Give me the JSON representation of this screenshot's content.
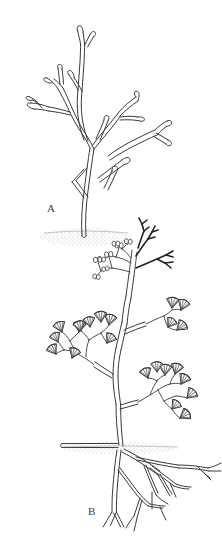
{
  "figure": {
    "background_color": "#ffffff",
    "ink_color": "#3a3a3a",
    "soil_color": "#9a9a9a",
    "width": 222,
    "height": 548
  },
  "panels": [
    {
      "id": "A",
      "label": "A",
      "caption": "Leafless dichotomously branching axes arising from a soil surface",
      "description": "Upright plant with repeatedly forking, naked, tapering axes ending in blunt rounded forked tips; slender basal stem emerging from a stippled ground patch.",
      "features": {
        "branching": "dichotomous",
        "leaves": "absent",
        "tip_shape": "blunt rounded fork",
        "substrate": "stippled soil mound",
        "root_system": "not shown"
      }
    },
    {
      "id": "B",
      "label": "B",
      "caption": "Branched shoot bearing fan-shaped leaves, terminal ovules and forked sporangiophores, with horizontal rhizome and dichotomous roots",
      "description": "Aerial axis forking repeatedly, bearing clusters of fan-shaped (flabellate) leaves with radiating veins; apex carries small paired ovules on slender stalks and dark narrow forked fertile branches; a horizontal rhizome runs left at the soil line and a spreading dichotomous root system descends to the right.",
      "features": {
        "branching": "dichotomous",
        "leaves": "fan-shaped with radiating veins",
        "fertile_structures": "paired stalked ovules and narrow forked sporangiophores",
        "rhizome": "horizontal, extends to the left at soil level",
        "root_system": "spreading, repeatedly forking"
      }
    }
  ],
  "icons": {
    "soil_line": "soil-line",
    "ground_stipple": "ground-stipple"
  }
}
